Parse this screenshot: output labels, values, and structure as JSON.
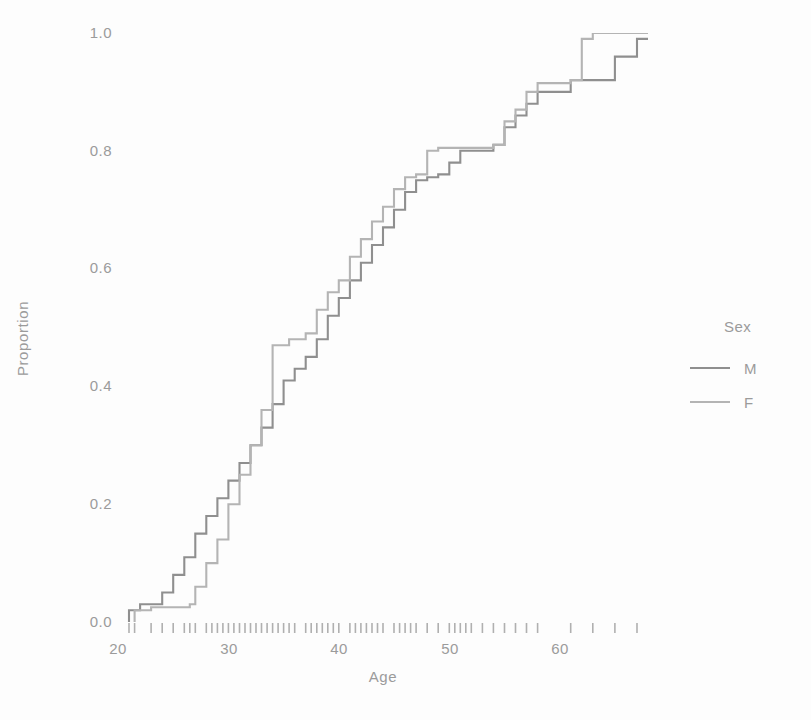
{
  "chart_data": {
    "type": "line",
    "title": "",
    "subtitle": "",
    "xlabel": "Age",
    "ylabel": "Proportion",
    "xlim": [
      20,
      68
    ],
    "ylim": [
      0.0,
      1.0
    ],
    "xticks": [
      20,
      30,
      40,
      50,
      60
    ],
    "yticks": [
      "0.0",
      "0.2",
      "0.4",
      "0.6",
      "0.8",
      "1.0"
    ],
    "grid": false,
    "legend": {
      "title": "Sex",
      "position": "right",
      "entries": [
        "M",
        "F"
      ]
    },
    "series": [
      {
        "name": "M",
        "color": "#8f8f8f",
        "step": "hv",
        "points": [
          [
            21.0,
            0.02
          ],
          [
            22.0,
            0.03
          ],
          [
            24.0,
            0.05
          ],
          [
            25.0,
            0.08
          ],
          [
            26.0,
            0.11
          ],
          [
            27.0,
            0.15
          ],
          [
            28.0,
            0.18
          ],
          [
            29.0,
            0.21
          ],
          [
            30.0,
            0.24
          ],
          [
            31.0,
            0.27
          ],
          [
            32.0,
            0.3
          ],
          [
            33.0,
            0.33
          ],
          [
            34.0,
            0.37
          ],
          [
            35.0,
            0.41
          ],
          [
            36.0,
            0.43
          ],
          [
            37.0,
            0.45
          ],
          [
            38.0,
            0.48
          ],
          [
            39.0,
            0.52
          ],
          [
            40.0,
            0.55
          ],
          [
            41.0,
            0.58
          ],
          [
            42.0,
            0.61
          ],
          [
            43.0,
            0.64
          ],
          [
            44.0,
            0.67
          ],
          [
            45.0,
            0.7
          ],
          [
            46.0,
            0.73
          ],
          [
            47.0,
            0.75
          ],
          [
            48.0,
            0.755
          ],
          [
            49.0,
            0.76
          ],
          [
            50.0,
            0.78
          ],
          [
            51.0,
            0.8
          ],
          [
            54.0,
            0.81
          ],
          [
            55.0,
            0.84
          ],
          [
            56.0,
            0.86
          ],
          [
            57.0,
            0.88
          ],
          [
            58.0,
            0.9
          ],
          [
            61.0,
            0.92
          ],
          [
            65.0,
            0.96
          ],
          [
            67.0,
            0.99
          ]
        ]
      },
      {
        "name": "F",
        "color": "#b4b4b4",
        "step": "hv",
        "points": [
          [
            21.5,
            0.02
          ],
          [
            23.0,
            0.025
          ],
          [
            26.5,
            0.03
          ],
          [
            27.0,
            0.06
          ],
          [
            28.0,
            0.1
          ],
          [
            29.0,
            0.14
          ],
          [
            30.0,
            0.2
          ],
          [
            31.0,
            0.25
          ],
          [
            32.0,
            0.3
          ],
          [
            33.0,
            0.36
          ],
          [
            34.0,
            0.47
          ],
          [
            35.5,
            0.48
          ],
          [
            37.0,
            0.49
          ],
          [
            38.0,
            0.53
          ],
          [
            39.0,
            0.56
          ],
          [
            40.0,
            0.58
          ],
          [
            41.0,
            0.62
          ],
          [
            42.0,
            0.65
          ],
          [
            43.0,
            0.68
          ],
          [
            44.0,
            0.705
          ],
          [
            45.0,
            0.735
          ],
          [
            46.0,
            0.755
          ],
          [
            47.0,
            0.76
          ],
          [
            48.0,
            0.8
          ],
          [
            49.0,
            0.805
          ],
          [
            54.0,
            0.81
          ],
          [
            55.0,
            0.85
          ],
          [
            56.0,
            0.87
          ],
          [
            57.0,
            0.9
          ],
          [
            58.0,
            0.915
          ],
          [
            61.0,
            0.92
          ],
          [
            62.0,
            0.99
          ],
          [
            63.0,
            1.0
          ],
          [
            68.0,
            1.0
          ]
        ]
      }
    ],
    "rug": {
      "label": "rug-marks",
      "values": [
        21.0,
        21.5,
        23.0,
        24.0,
        25.0,
        26.0,
        26.5,
        27.0,
        28.0,
        28.5,
        29.0,
        29.5,
        30.0,
        30.5,
        31.0,
        31.5,
        32.0,
        32.5,
        33.0,
        33.5,
        34.0,
        34.5,
        35.0,
        35.5,
        36.0,
        37.0,
        37.5,
        38.0,
        38.5,
        39.0,
        39.5,
        40.0,
        41.0,
        41.5,
        42.0,
        42.5,
        43.0,
        43.5,
        44.0,
        45.0,
        45.5,
        46.0,
        46.5,
        47.0,
        48.0,
        49.0,
        50.0,
        50.5,
        51.0,
        51.5,
        52.0,
        53.0,
        54.0,
        55.0,
        56.0,
        57.0,
        58.0,
        61.0,
        63.0,
        65.0,
        67.0
      ]
    }
  },
  "axes": {
    "ylabel": "Proportion",
    "xlabel": "Age",
    "yticks": [
      "1.0",
      "0.8",
      "0.6",
      "0.4",
      "0.2",
      "0.0"
    ],
    "xticks": [
      "20",
      "30",
      "40",
      "50",
      "60"
    ]
  },
  "legend": {
    "title": "Sex",
    "items": [
      {
        "label": "M",
        "color": "#8f8f8f"
      },
      {
        "label": "F",
        "color": "#b4b4b4"
      }
    ]
  }
}
